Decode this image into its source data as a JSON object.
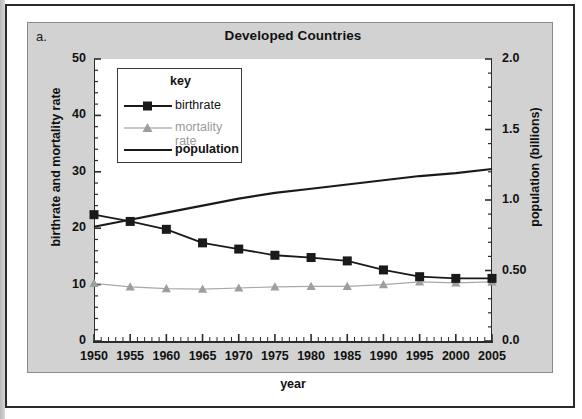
{
  "figure": {
    "panel_label": "a.",
    "title": "Developed Countries"
  },
  "colors": {
    "panel_background": "#d2d2d2",
    "plot_background": "#ffffff",
    "birthrate": "#1a1a1a",
    "mortality": "#a8a8a8",
    "population": "#1a1a1a",
    "axis": "#2b2b2b"
  },
  "legend": {
    "title": "key",
    "entries": [
      {
        "label": "birthrate",
        "style": "line-square-marker",
        "color": "#1a1a1a"
      },
      {
        "label": "mortality rate",
        "style": "line-triangle-marker",
        "color": "#a8a8a8"
      },
      {
        "label": "population",
        "style": "plain-line",
        "color": "#1a1a1a"
      }
    ]
  },
  "chart_data": {
    "type": "line",
    "title": "Developed Countries",
    "xlabel": "year",
    "ylabel": "birthrate and mortality rate",
    "y2label": "population (billions)",
    "x": [
      1950,
      1955,
      1960,
      1965,
      1970,
      1975,
      1980,
      1985,
      1990,
      1995,
      2000,
      2005
    ],
    "xlim": [
      1950,
      2005
    ],
    "xticklabels": [
      "1950",
      "1955",
      "1960",
      "1965",
      "1970",
      "1975",
      "1980",
      "1985",
      "1990",
      "1995",
      "2000",
      "2005"
    ],
    "ylim": [
      0,
      50
    ],
    "yticklabels": [
      "0",
      "10",
      "20",
      "30",
      "40",
      "50"
    ],
    "ytickvalues": [
      0,
      10,
      20,
      30,
      40,
      50
    ],
    "y2lim": [
      0.0,
      2.0
    ],
    "y2ticklabels": [
      "0.0",
      "0.50",
      "1.0",
      "1.5",
      "2.0"
    ],
    "y2tickvalues": [
      0.0,
      0.5,
      1.0,
      1.5,
      2.0
    ],
    "grid": false,
    "legend_position": "upper-left-inside",
    "minor_ticks": true,
    "series": [
      {
        "name": "birthrate",
        "axis": "left",
        "marker": "square",
        "color": "#1a1a1a",
        "values": [
          22.4,
          21.2,
          19.8,
          17.4,
          16.3,
          15.2,
          14.8,
          14.2,
          12.6,
          11.4,
          11.1,
          11.1
        ]
      },
      {
        "name": "mortality rate",
        "axis": "left",
        "marker": "triangle",
        "color": "#a8a8a8",
        "values": [
          10.2,
          9.6,
          9.3,
          9.2,
          9.4,
          9.6,
          9.7,
          9.7,
          10.0,
          10.5,
          10.3,
          10.5
        ]
      },
      {
        "name": "population",
        "axis": "right",
        "marker": "none",
        "color": "#1a1a1a",
        "values": [
          0.81,
          0.86,
          0.91,
          0.96,
          1.01,
          1.05,
          1.08,
          1.11,
          1.14,
          1.17,
          1.19,
          1.22
        ]
      }
    ]
  }
}
